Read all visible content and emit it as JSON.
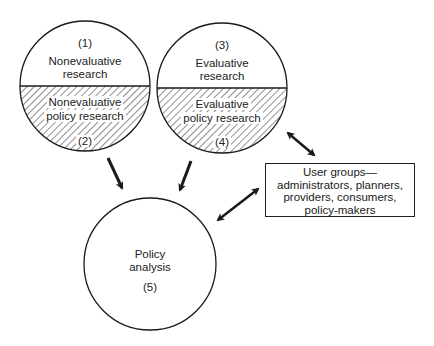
{
  "diagram": {
    "circles": [
      {
        "id": 1,
        "number": "(1)",
        "label_line1": "Nonevaluative",
        "label_line2": "research"
      },
      {
        "id": 2,
        "number": "(2)",
        "label_line1": "Nonevaluative",
        "label_line2": "policy research"
      },
      {
        "id": 3,
        "number": "(3)",
        "label_line1": "Evaluative",
        "label_line2": "research"
      },
      {
        "id": 4,
        "number": "(4)",
        "label_line1": "Evaluative",
        "label_line2": "policy research"
      },
      {
        "id": 5,
        "number": "(5)",
        "label_line1": "Policy",
        "label_line2": "analysis"
      }
    ],
    "user_box": {
      "line1": "User groups—",
      "line2": "administrators, planners,",
      "line3": "providers, consumers,",
      "line4": "policy-makers"
    },
    "colors": {
      "stroke": "#1a1a1a",
      "background": "#ffffff"
    }
  }
}
